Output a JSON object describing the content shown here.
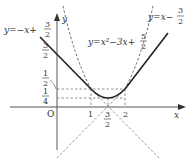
{
  "figure": {
    "curves": {
      "line_left": {
        "label": "y=−x+",
        "frac_num": "3",
        "frac_den": "2",
        "equation": "y = -x + 3/2"
      },
      "line_right": {
        "label": "y=x−",
        "frac_num": "3",
        "frac_den": "2",
        "equation": "y = x - 3/2"
      },
      "parabola": {
        "label": "y=x²−3x+",
        "frac_num": "5",
        "frac_den": "2",
        "equation": "y = x^2 - 3x + 5/2"
      }
    },
    "axes": {
      "x_label": "x",
      "y_label": "y",
      "origin_label": "O"
    },
    "y_ticks": [
      {
        "num": "3",
        "den": "2"
      },
      {
        "num": "1",
        "den": "2"
      },
      {
        "num": "1",
        "den": "4"
      }
    ],
    "x_ticks": {
      "one": "1",
      "two": "2",
      "three_half_num": "3",
      "three_half_den": "2"
    },
    "colors": {
      "curve": "#222222",
      "dashed": "#777777",
      "axis": "#555555"
    }
  }
}
